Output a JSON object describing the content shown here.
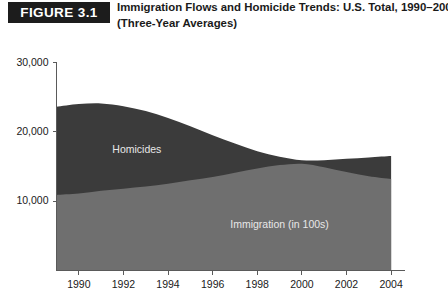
{
  "header": {
    "badge_label": "FIGURE 3.1",
    "title_line1": "Immigration Flows and Homicide Trends: U.S. Total, 1990–2004",
    "title_line2": "(Three-Year Averages)"
  },
  "colors": {
    "homicides_band": "#3b3b3b",
    "immigration_band": "#6f6f6f",
    "axis": "#5a5a5a",
    "badge_bg": "#1c1c1c",
    "text": "#1a1a1a",
    "inline_label_text": "#e8e8e8"
  },
  "chart_data": {
    "type": "area",
    "stacked": false,
    "title": "Immigration Flows and Homicide Trends: U.S. Total, 1990–2004 (Three-Year Averages)",
    "xlabel": "",
    "ylabel": "",
    "xlim": [
      1989,
      2004.6
    ],
    "ylim": [
      0,
      30000
    ],
    "grid": false,
    "legend_position": "inline-annotation",
    "yticks": [
      10000,
      20000,
      30000
    ],
    "ytick_labels": [
      "10,000",
      "20,000",
      "30,000"
    ],
    "xticks": [
      1990,
      1992,
      1994,
      1996,
      1998,
      2000,
      2002,
      2004
    ],
    "xtick_labels": [
      "1990",
      "1992",
      "1994",
      "1996",
      "1998",
      "2000",
      "2002",
      "2004"
    ],
    "annotations": [
      {
        "text": "Homicides",
        "x": 1992.6,
        "y": 17000
      },
      {
        "text": "Immigration (in 100s)",
        "x": 1999.0,
        "y": 6200
      }
    ],
    "x": [
      1989.0,
      1990.0,
      1991.0,
      1992.0,
      1993.0,
      1994.0,
      1995.0,
      1996.0,
      1997.0,
      1998.0,
      1999.0,
      2000.0,
      2001.0,
      2002.0,
      2003.0,
      2004.0
    ],
    "series": [
      {
        "name": "Homicides",
        "color": "#3b3b3b",
        "values": [
          23600,
          24000,
          24100,
          23700,
          23000,
          22000,
          20800,
          19500,
          18300,
          17200,
          16400,
          15900,
          15900,
          16100,
          16300,
          16500
        ]
      },
      {
        "name": "Immigration (in 100s)",
        "color": "#6f6f6f",
        "values": [
          10900,
          11100,
          11500,
          11800,
          12100,
          12500,
          13000,
          13500,
          14100,
          14700,
          15200,
          15400,
          14900,
          14200,
          13600,
          13200
        ]
      }
    ]
  }
}
